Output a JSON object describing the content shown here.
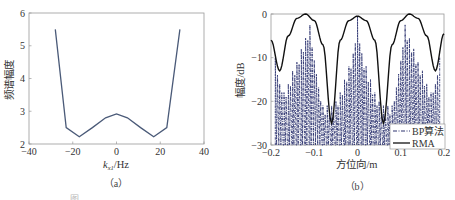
{
  "chart_data": [
    {
      "type": "line",
      "panel": "a",
      "caption": "（a）",
      "title": "",
      "xlabel": "k_x1/Hz",
      "xlabel_main": "k",
      "xlabel_sub": "x1",
      "xlabel_unit": "/Hz",
      "ylabel": "频谱幅度",
      "xlim": [
        -40,
        40
      ],
      "ylim": [
        2,
        6
      ],
      "xticks": [
        -40,
        -20,
        0,
        20,
        40
      ],
      "yticks": [
        2,
        3,
        4,
        5,
        6
      ],
      "grid": false,
      "series": [
        {
          "name": "spectrum",
          "color": "#4a5a78",
          "x": [
            -28,
            -23,
            -17,
            -11,
            -5,
            0,
            5,
            11,
            17,
            23,
            29
          ],
          "values": [
            5.5,
            2.5,
            2.22,
            2.5,
            2.8,
            2.92,
            2.8,
            2.5,
            2.22,
            2.5,
            5.5
          ]
        }
      ]
    },
    {
      "type": "line",
      "panel": "b",
      "caption": "（b）",
      "title": "",
      "xlabel": "方位向/m",
      "ylabel": "幅度/dB",
      "xlim": [
        -0.2,
        0.2
      ],
      "ylim": [
        -30,
        0
      ],
      "xticks": [
        -0.2,
        -0.1,
        0,
        0.1,
        0.2
      ],
      "yticks": [
        0,
        -10,
        -20,
        -30
      ],
      "grid": false,
      "legend_position": "lower right",
      "legend": [
        "BP算法",
        "RMA"
      ],
      "series": [
        {
          "name": "RMA",
          "style": "solid",
          "color": "#111111",
          "x": [
            -0.2,
            -0.18,
            -0.16,
            -0.14,
            -0.12,
            -0.1,
            -0.08,
            -0.06,
            -0.04,
            -0.02,
            0,
            0.02,
            0.04,
            0.06,
            0.08,
            0.1,
            0.12,
            0.14,
            0.16,
            0.18,
            0.2
          ],
          "values": [
            -6,
            -13,
            -5,
            -1,
            0,
            -1.5,
            -7,
            -25,
            -6,
            -1.5,
            -0.5,
            -1.5,
            -6,
            -25,
            -7,
            -1.5,
            0,
            -1,
            -5,
            -13,
            -4.5
          ]
        },
        {
          "name": "BP算法",
          "style": "dash-dot",
          "color": "#2e3470",
          "peaks_x": [
            -0.19,
            -0.17,
            -0.16,
            -0.15,
            -0.14,
            -0.13,
            -0.12,
            -0.11,
            -0.08,
            -0.07,
            -0.06,
            -0.05,
            -0.04,
            -0.03,
            -0.02,
            -0.01,
            0,
            0.01,
            0.02,
            0.03,
            0.04,
            0.05,
            0.06,
            0.07,
            0.08,
            0.11,
            0.12,
            0.13,
            0.14,
            0.15,
            0.16,
            0.17,
            0.19
          ],
          "peaks_values": [
            -10,
            -18,
            -16,
            -13,
            -11,
            -8,
            -5.5,
            -2.5,
            -21,
            -21,
            -21,
            -20,
            -18,
            -15,
            -12,
            -9,
            -0.5,
            -9,
            -12,
            -15,
            -18,
            -20,
            -21,
            -21,
            -21,
            -2.5,
            -5.5,
            -8,
            -11,
            -13,
            -16,
            -18,
            -10
          ],
          "null_floor": -30
        }
      ]
    }
  ],
  "footer_text": "图"
}
